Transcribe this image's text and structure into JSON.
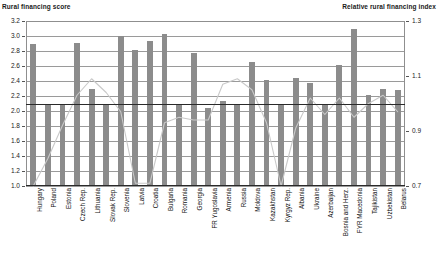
{
  "axes": {
    "left_title": "Rural financing score",
    "right_title": "Relative rural financing index",
    "left_ticks": [
      "3.2",
      "3.0",
      "2.8",
      "2.6",
      "2.4",
      "2.2",
      "2.0",
      "1.8",
      "1.6",
      "1.4",
      "1.2",
      "1.0"
    ],
    "right_ticks": [
      "1.3",
      "1.1",
      "0.9",
      "0.7"
    ]
  },
  "chart_data": {
    "type": "bar",
    "title": "",
    "subtitle": "",
    "xlabel": "",
    "ylabel": "Rural financing score",
    "y2label": "Relative rural financing index",
    "ylim": [
      1.0,
      3.2
    ],
    "y2lim": [
      0.7,
      1.3
    ],
    "grid": true,
    "legend": "none",
    "reference_line": {
      "label": "Rural financing score reference",
      "value": 2.1,
      "axis": "left"
    },
    "categories": [
      "Hungary",
      "Poland",
      "Estonia",
      "Czech Rep.",
      "Lithuania",
      "Slovak Rep.",
      "Slovenia",
      "Latvia",
      "Croatia",
      "Bulgaria",
      "Romania",
      "Georgia",
      "FR Yugoslavia",
      "Armenia",
      "Russia",
      "Moldova",
      "Kazakhstan",
      "Kyrgyz Rep.",
      "Albania",
      "Ukraine",
      "Azerbaijan",
      "Bosnia and Herz.",
      "FYR Macedonia",
      "Tajikistan",
      "Uzbekistan",
      "Belarus"
    ],
    "series": [
      {
        "name": "Rural financing score",
        "type": "bar",
        "axis": "left",
        "color": "#8c8c8c",
        "values": [
          2.9,
          2.1,
          2.1,
          2.91,
          2.3,
          2.1,
          3.0,
          2.82,
          2.94,
          3.03,
          2.1,
          2.78,
          2.04,
          2.13,
          2.1,
          2.65,
          2.42,
          2.1,
          2.44,
          2.38,
          2.1,
          2.62,
          3.1,
          2.22,
          2.3,
          2.28
        ]
      },
      {
        "name": "Relative rural financing index",
        "type": "line",
        "axis": "right",
        "color": "#c9c9c9",
        "values": [
          0.7,
          0.8,
          0.92,
          1.03,
          1.09,
          1.04,
          0.97,
          0.71,
          0.71,
          0.93,
          0.95,
          0.94,
          0.94,
          1.07,
          1.09,
          1.05,
          0.93,
          0.7,
          0.91,
          1.02,
          0.96,
          1.02,
          0.95,
          1.0,
          1.03,
          0.97
        ]
      }
    ]
  }
}
